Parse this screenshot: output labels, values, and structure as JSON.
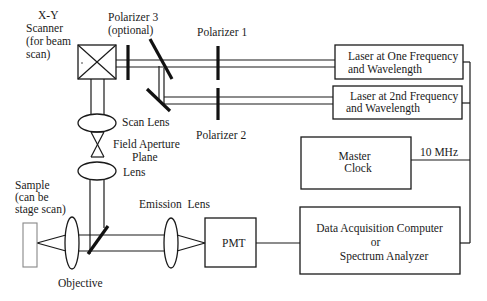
{
  "diagram": {
    "type": "optical-setup-block-diagram",
    "labels": {
      "xy_scanner": [
        "X-Y",
        "Scanner",
        "(for beam",
        "scan)"
      ],
      "polarizer3": [
        "Polarizer 3",
        "(optional)"
      ],
      "polarizer1": "Polarizer 1",
      "polarizer2": "Polarizer 2",
      "laser1": [
        "Laser at One Frequency",
        "and Wavelength"
      ],
      "laser2": [
        "Laser at 2nd Frequency",
        "and Wavelength"
      ],
      "scan_lens": "Scan Lens",
      "field_aperture": [
        "Field Aperture",
        "Plane"
      ],
      "lens": "Lens",
      "sample": [
        "Sample",
        "(can be",
        "stage scan)"
      ],
      "emission_lens": "Emission  Lens",
      "objective": "Objective",
      "pmt": "PMT",
      "master_clock": [
        "Master",
        "Clock"
      ],
      "clock_freq": "10 MHz",
      "daq": [
        "Data Acquisition Computer",
        "or",
        "Spectrum Analyzer"
      ]
    },
    "colors": {
      "line": "#1a1a1a",
      "background": "#ffffff",
      "sample_outline": "#888888"
    }
  }
}
